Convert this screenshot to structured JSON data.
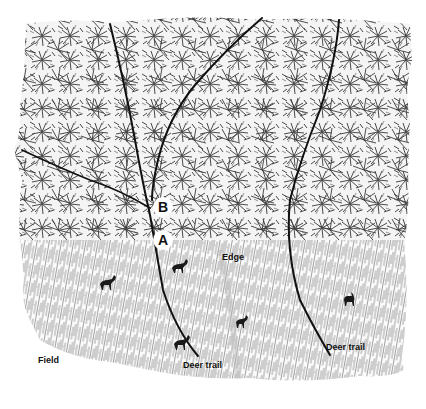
{
  "illustration": {
    "subject": "Deer trails through forest edge and field",
    "regions": {
      "forest": "dense tree canopy (upper area)",
      "field": "tall grass field (lower area)"
    },
    "labels": {
      "field": "Field",
      "edge": "Edge",
      "deer_trail_left": "Deer trail",
      "deer_trail_right": "Deer trail"
    },
    "markers": {
      "a": "A",
      "b": "B"
    },
    "deer_count": 5,
    "trail_count": 4,
    "colors": {
      "ink": "#111111",
      "canopy": "#555555",
      "grass": "#777777",
      "background": "#ffffff"
    }
  }
}
